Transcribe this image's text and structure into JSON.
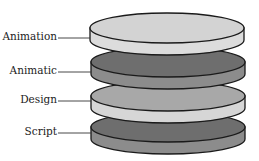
{
  "diagram": {
    "type": "stacked-layers",
    "layers": [
      {
        "label": "Animation",
        "top_fill": "#d3d3d3",
        "side_fill": "#dcdcdc"
      },
      {
        "label": "Animatic",
        "top_fill": "#6e6e6e",
        "side_fill": "#8c8c8c"
      },
      {
        "label": "Design",
        "top_fill": "#a8a8a8",
        "side_fill": "#d6d6d6"
      },
      {
        "label": "Script",
        "top_fill": "#6e6e6e",
        "side_fill": "#8c8c8c"
      }
    ]
  }
}
